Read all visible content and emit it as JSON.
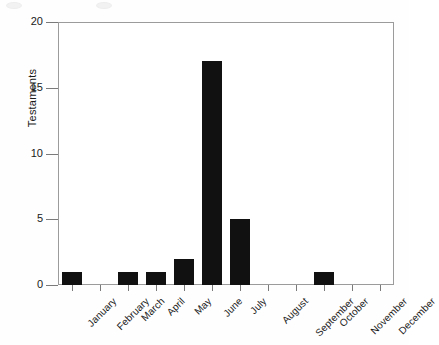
{
  "chart_data": {
    "type": "bar",
    "title": "",
    "subtitle": "",
    "xlabel": "",
    "ylabel": "Testaments",
    "categories": [
      "January",
      "February",
      "March",
      "April",
      "May",
      "June",
      "July",
      "August",
      "September",
      "October",
      "November",
      "December"
    ],
    "values": [
      1,
      0,
      1,
      1,
      2,
      17,
      5,
      0,
      0,
      1,
      0,
      0
    ],
    "ylim": [
      0,
      20
    ],
    "y_ticks": [
      0,
      5,
      10,
      15,
      20
    ],
    "y_tick_labels": [
      "0",
      "5",
      "10",
      "15",
      "20"
    ],
    "grid": false,
    "legend": false,
    "legend_position": "none",
    "bar_color": "#111111",
    "axis_color": "#9b9b9b",
    "text_color": "#1a1a1a",
    "x_tick_label_rotation": -45,
    "annotations": []
  },
  "axes": {
    "y_title": "Testaments"
  }
}
